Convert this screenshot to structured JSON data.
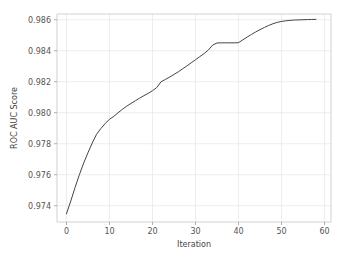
{
  "chart_data": {
    "type": "line",
    "title": "",
    "xlabel": "Iteration",
    "ylabel": "ROC AUC Score",
    "xlim": [
      -2.2,
      61.5
    ],
    "ylim": [
      0.97295,
      0.98637
    ],
    "xticks": [
      0,
      10,
      20,
      30,
      40,
      50,
      60
    ],
    "xticklabels": [
      "0",
      "10",
      "20",
      "30",
      "40",
      "50",
      "60"
    ],
    "yticks": [
      0.974,
      0.976,
      0.978,
      0.98,
      0.982,
      0.984,
      0.986
    ],
    "yticklabels": [
      "0.974",
      "0.976",
      "0.978",
      "0.980",
      "0.982",
      "0.984",
      "0.986"
    ],
    "grid": true,
    "grid_color": "#e8e8e8",
    "legend": null,
    "line_color": "#444444",
    "line_width": 1.0,
    "background": "#ffffff",
    "series": [
      {
        "name": "ROC AUC Score",
        "x": [
          0,
          1,
          2,
          3,
          4,
          5,
          6,
          7,
          8,
          9,
          10,
          11,
          12,
          13,
          14,
          15,
          16,
          17,
          18,
          19,
          20,
          21,
          22,
          23,
          24,
          25,
          26,
          27,
          28,
          29,
          30,
          31,
          32,
          33,
          34,
          35,
          36,
          37,
          38,
          39,
          40,
          41,
          42,
          43,
          44,
          45,
          46,
          47,
          48,
          49,
          50,
          51,
          52,
          53,
          54,
          55,
          56,
          57,
          58
        ],
        "y": [
          0.97348,
          0.9743,
          0.97518,
          0.976,
          0.97675,
          0.97742,
          0.97805,
          0.97861,
          0.97898,
          0.9793,
          0.97958,
          0.97976,
          0.98,
          0.98022,
          0.98042,
          0.9806,
          0.98077,
          0.98094,
          0.9811,
          0.98125,
          0.98142,
          0.98163,
          0.982,
          0.98215,
          0.9823,
          0.98247,
          0.98264,
          0.98283,
          0.98302,
          0.98322,
          0.98342,
          0.98362,
          0.98382,
          0.98405,
          0.98437,
          0.9845,
          0.98451,
          0.98451,
          0.98451,
          0.98451,
          0.98452,
          0.9847,
          0.98488,
          0.98505,
          0.98521,
          0.98536,
          0.9855,
          0.98563,
          0.98574,
          0.98583,
          0.98589,
          0.98593,
          0.98596,
          0.98598,
          0.98599,
          0.986,
          0.98601,
          0.98602,
          0.98602
        ]
      }
    ]
  },
  "axes": {
    "xlabel": "Iteration",
    "ylabel": "ROC AUC Score"
  }
}
